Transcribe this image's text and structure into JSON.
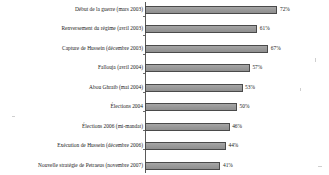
{
  "chart_data": {
    "type": "bar",
    "orientation": "horizontal",
    "title": "",
    "xlabel": "",
    "ylabel": "",
    "xlim": [
      0,
      100
    ],
    "grid": false,
    "legend": null,
    "value_suffix": "%",
    "categories": [
      "Début de la guerre (mars 2003)",
      "Renversement du régime (avril 2003)",
      "Capture de Hussein (décembre 2003)",
      "Fallouja (avril 2004)",
      "Abou Ghraib (mai 2004)",
      "Élections 2004",
      "Élections 2006 (mi-mandat)",
      "Exécution de Hussein (décembre 2006)",
      "Nouvelle stratégie de Petraeus (novembre 2007)"
    ],
    "values": [
      72,
      61,
      67,
      57,
      53,
      50,
      46,
      44,
      41
    ],
    "value_labels": [
      "72%",
      "61%",
      "67%",
      "57%",
      "53%",
      "50%",
      "46%",
      "44%",
      "41%"
    ],
    "bar_color": "#9a9a9a",
    "bar_border_color": "#4a4a4a",
    "axis_color": "#5a5a5a",
    "text_color": "#1a1a1a",
    "background_color": "#ffffff"
  }
}
